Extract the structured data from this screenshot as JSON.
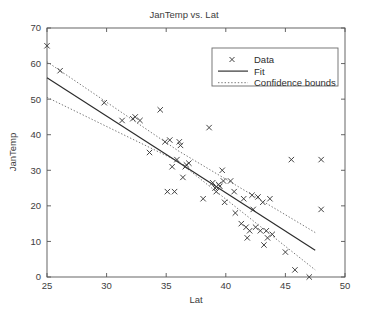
{
  "chart_data": {
    "type": "scatter",
    "title": "JanTemp vs. Lat",
    "xlabel": "Lat",
    "ylabel": "JanTemp",
    "xlim": [
      25,
      50
    ],
    "ylim": [
      0,
      70
    ],
    "xticks": [
      25,
      30,
      35,
      40,
      45,
      50
    ],
    "yticks": [
      0,
      10,
      20,
      30,
      40,
      50,
      60,
      70
    ],
    "grid": false,
    "legend_position": "top-right",
    "legend": [
      {
        "label": "Data",
        "marker": "x"
      },
      {
        "label": "Fit",
        "marker": "solid-line"
      },
      {
        "label": "Confidence bounds",
        "marker": "dotted-line"
      }
    ],
    "series": [
      {
        "name": "Data",
        "marker": "x",
        "points": [
          [
            25.0,
            65.0
          ],
          [
            26.1,
            58.0
          ],
          [
            29.8,
            49.0
          ],
          [
            31.3,
            44.0
          ],
          [
            32.2,
            44.5
          ],
          [
            32.4,
            45.0
          ],
          [
            32.8,
            44.0
          ],
          [
            33.6,
            35.0
          ],
          [
            34.5,
            47.0
          ],
          [
            34.9,
            38.0
          ],
          [
            35.1,
            24.0
          ],
          [
            35.3,
            38.5
          ],
          [
            35.5,
            31.0
          ],
          [
            35.7,
            24.0
          ],
          [
            35.9,
            33.0
          ],
          [
            36.1,
            38.0
          ],
          [
            36.2,
            37.0
          ],
          [
            36.4,
            28.0
          ],
          [
            36.6,
            31.0
          ],
          [
            36.7,
            31.5
          ],
          [
            36.9,
            32.0
          ],
          [
            38.1,
            22.0
          ],
          [
            38.6,
            42.0
          ],
          [
            38.9,
            26.5
          ],
          [
            39.1,
            25.0
          ],
          [
            39.2,
            24.0
          ],
          [
            39.4,
            26.0
          ],
          [
            39.5,
            25.5
          ],
          [
            39.7,
            30.0
          ],
          [
            39.8,
            27.0
          ],
          [
            39.9,
            21.0
          ],
          [
            40.4,
            27.0
          ],
          [
            40.7,
            24.0
          ],
          [
            40.8,
            18.0
          ],
          [
            41.3,
            15.0
          ],
          [
            41.5,
            22.0
          ],
          [
            41.7,
            14.0
          ],
          [
            41.8,
            11.0
          ],
          [
            42.0,
            13.0
          ],
          [
            42.2,
            23.0
          ],
          [
            42.3,
            19.0
          ],
          [
            42.5,
            14.0
          ],
          [
            42.7,
            22.5
          ],
          [
            42.9,
            13.0
          ],
          [
            43.1,
            21.0
          ],
          [
            43.2,
            9.0
          ],
          [
            43.4,
            13.0
          ],
          [
            43.5,
            11.0
          ],
          [
            43.7,
            22.0
          ],
          [
            43.9,
            12.0
          ],
          [
            45.0,
            7.0
          ],
          [
            45.5,
            33.0
          ],
          [
            45.8,
            2.0
          ],
          [
            47.0,
            0.0
          ],
          [
            48.0,
            33.0
          ],
          [
            48.0,
            19.0
          ]
        ]
      }
    ],
    "fit": {
      "name": "Fit",
      "style": "solid",
      "x": [
        25.0,
        47.5
      ],
      "y": [
        56.0,
        7.5
      ]
    },
    "confidence_bounds": {
      "name": "Confidence bounds",
      "style": "dotted",
      "upper": {
        "x": [
          25.0,
          36.0,
          47.5
        ],
        "y": [
          60.5,
          35.5,
          12.5
        ]
      },
      "lower": {
        "x": [
          25.0,
          36.0,
          47.5
        ],
        "y": [
          50.5,
          32.5,
          2.0
        ]
      }
    }
  }
}
